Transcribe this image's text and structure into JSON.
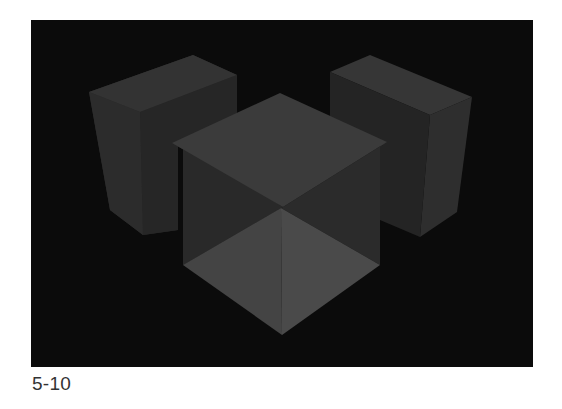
{
  "figure": {
    "caption": "5-10",
    "background_color": "#0b0b0b",
    "objects": [
      {
        "name": "left-box",
        "shape": "rectangular prism"
      },
      {
        "name": "right-box",
        "shape": "rectangular prism"
      },
      {
        "name": "center-cube",
        "shape": "cube with pyramidal underside"
      }
    ],
    "colors": {
      "top_face": "#3b3b3b",
      "side_face_dark": "#262626",
      "side_face_mid": "#2e2e2e",
      "pyramid_left": "#444444",
      "pyramid_right": "#4a4a4a"
    }
  }
}
